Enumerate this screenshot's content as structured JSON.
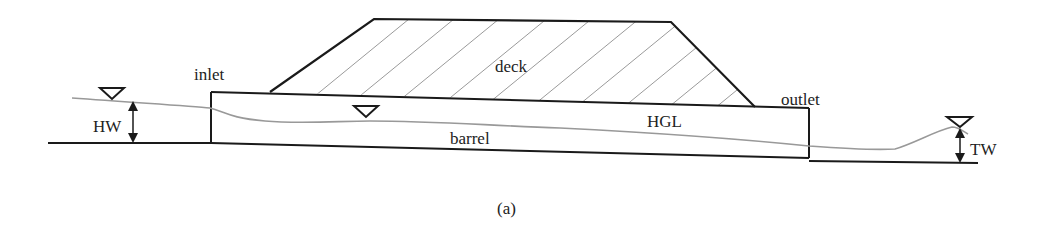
{
  "figure": {
    "caption": "(a)"
  },
  "labels": {
    "deck": "deck",
    "inlet": "inlet",
    "outlet": "outlet",
    "barrel": "barrel",
    "hgl": "HGL",
    "headwater": "HW",
    "tailwater": "TW"
  },
  "colors": {
    "structure": "#1a1a1a",
    "hatch": "#9a9a9a",
    "water_surface": "#999999",
    "text": "#222222",
    "background": "#ffffff"
  },
  "symbols": [
    {
      "name": "headwater-level-symbol",
      "glyph": "inverted-triangle"
    },
    {
      "name": "barrel-water-level-symbol",
      "glyph": "inverted-triangle"
    },
    {
      "name": "tailwater-level-symbol",
      "glyph": "inverted-triangle"
    }
  ]
}
